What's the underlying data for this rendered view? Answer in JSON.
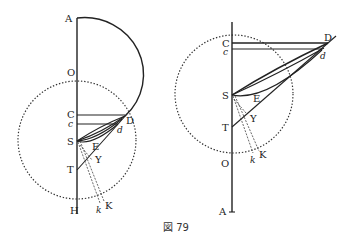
{
  "figure": {
    "caption": "図 79",
    "left": {
      "labels": {
        "A": "A",
        "O": "O",
        "C": "C",
        "c": "c",
        "D": "D",
        "d": "d",
        "S": "S",
        "E": "E",
        "Y": "Y",
        "T": "T",
        "H": "H",
        "k": "k",
        "K": "K"
      }
    },
    "right": {
      "labels": {
        "C": "C",
        "c": "c",
        "D": "D",
        "d": "d",
        "S": "S",
        "E": "E",
        "Y": "Y",
        "T": "T",
        "O": "O",
        "k": "k",
        "K": "K",
        "A": "A"
      }
    }
  }
}
